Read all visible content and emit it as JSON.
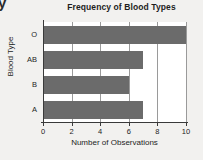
{
  "stray_glyph": "y",
  "chart_data": {
    "type": "bar",
    "orientation": "horizontal",
    "title": "Frequency of Blood Types",
    "xlabel": "Number of Observations",
    "ylabel": "Blood Type",
    "categories": [
      "A",
      "B",
      "AB",
      "O"
    ],
    "values": [
      7,
      6,
      7,
      10
    ],
    "xlim": [
      0,
      10
    ],
    "xticks": [
      0,
      2,
      4,
      6,
      8,
      10
    ],
    "xtick_labels": [
      "0",
      "2",
      "4",
      "6",
      "8",
      "10"
    ],
    "grid": "vertical",
    "legend": "none",
    "bar_color": "#6b6b6b",
    "plot_background": "#ffffff",
    "figure_background": "#f2f1ef",
    "axis_color": "#3a3a3a",
    "gridline_color": "#9a9a9a",
    "series": [
      {
        "name": "Observations",
        "points": [
          {
            "category": "O",
            "value": 10
          },
          {
            "category": "AB",
            "value": 7
          },
          {
            "category": "B",
            "value": 6
          },
          {
            "category": "A",
            "value": 7
          }
        ]
      }
    ]
  }
}
